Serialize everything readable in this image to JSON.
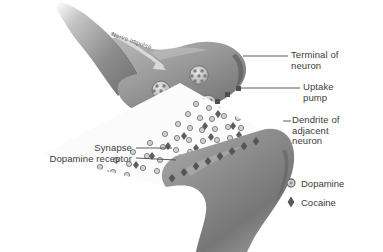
{
  "figure": {
    "background_color": "#ffffff",
    "ink_color": "#3b3b3b",
    "cell_fill_dark": "#6f6f6f",
    "cell_fill_mid": "#9a9a9a",
    "cell_fill_light": "#c9c9c9",
    "cleft_color": "#fbfbfb"
  },
  "annotations": {
    "nerve_impulse": "Nerve impulse",
    "terminal_of_neuron": "Terminal of\nneuron",
    "uptake_pump": "Uptake\npump",
    "dendrite_of_adjacent_neuron": "Dendrite of\nadjacent\nneuron",
    "synapse": "Synapse",
    "dopamine_receptor": "Dopamine receptor"
  },
  "legend": {
    "items": [
      {
        "label": "Dopamine",
        "marker": "circle-ring-icon",
        "color": "#8a8a8a"
      },
      {
        "label": "Cocaine",
        "marker": "diamond-icon",
        "color": "#5a5a5a"
      }
    ]
  }
}
